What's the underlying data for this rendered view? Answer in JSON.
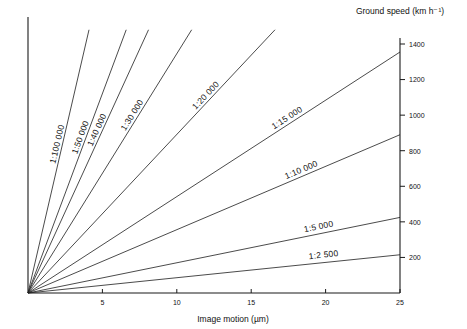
{
  "chart_data": {
    "type": "line",
    "title": "",
    "subtitle": "",
    "xlabel": "Image motion (µm)",
    "ylabel": "Ground speed (km h⁻¹)",
    "xlim": [
      0,
      25
    ],
    "ylim": [
      0,
      1480
    ],
    "xticks": [
      5,
      10,
      15,
      20,
      25
    ],
    "xtick_labels": [
      "5",
      "10",
      "15",
      "20",
      "25"
    ],
    "yticks": [
      200,
      400,
      600,
      800,
      1000,
      1200,
      1400
    ],
    "ytick_labels": [
      "200",
      "400",
      "600",
      "800",
      "1000",
      "1200",
      "1400"
    ],
    "grid": false,
    "legend": "inline-labels-on-lines",
    "series": [
      {
        "name": "1:100 000",
        "label": "1:100 000",
        "scale_denominator": 100000,
        "x": [
          0,
          4.1
        ],
        "y": [
          0,
          1480
        ],
        "label_x": 2.3,
        "label_y": 830
      },
      {
        "name": "1:50 000",
        "label": "1:50 000",
        "scale_denominator": 50000,
        "x": [
          0,
          6.6
        ],
        "y": [
          0,
          1480
        ],
        "label_x": 3.85,
        "label_y": 865
      },
      {
        "name": "1:40 000",
        "label": "1:40 000",
        "scale_denominator": 40000,
        "x": [
          0,
          8.1
        ],
        "y": [
          0,
          1480
        ],
        "label_x": 4.95,
        "label_y": 905
      },
      {
        "name": "1:30 000",
        "label": "1:30 000",
        "scale_denominator": 30000,
        "x": [
          0,
          11.0
        ],
        "y": [
          0,
          1480
        ],
        "label_x": 7.3,
        "label_y": 985
      },
      {
        "name": "1:20 000",
        "label": "1:20 000",
        "scale_denominator": 20000,
        "x": [
          0,
          16.6
        ],
        "y": [
          0,
          1480
        ],
        "label_x": 12.2,
        "label_y": 1090
      },
      {
        "name": "1:15 000",
        "label": "1:15 000",
        "scale_denominator": 15000,
        "x": [
          0,
          25.0
        ],
        "y": [
          0,
          1355
        ],
        "label_x": 17.6,
        "label_y": 960
      },
      {
        "name": "1:10 000",
        "label": "1:10 000",
        "scale_denominator": 10000,
        "x": [
          0,
          25.0
        ],
        "y": [
          0,
          890
        ],
        "label_x": 18.5,
        "label_y": 665
      },
      {
        "name": "1:5 000",
        "label": "1:5 000",
        "scale_denominator": 5000,
        "x": [
          0,
          25.0
        ],
        "y": [
          0,
          425
        ],
        "label_x": 19.6,
        "label_y": 345
      },
      {
        "name": "1:2 500",
        "label": "1:2 500",
        "scale_denominator": 2500,
        "x": [
          0,
          25.0
        ],
        "y": [
          0,
          215
        ],
        "label_x": 19.9,
        "label_y": 185
      }
    ]
  },
  "axes": {
    "x_title": "Image motion (µm)",
    "y_title": "Ground speed (km h⁻¹)"
  }
}
